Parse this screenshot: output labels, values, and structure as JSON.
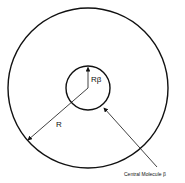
{
  "diagram": {
    "labels": {
      "inner_radius": "Rβ",
      "outer_radius": "R",
      "central_molecule": "Central Molecule β"
    },
    "colors": {
      "stroke": "#111111",
      "background": "#ffffff"
    }
  }
}
